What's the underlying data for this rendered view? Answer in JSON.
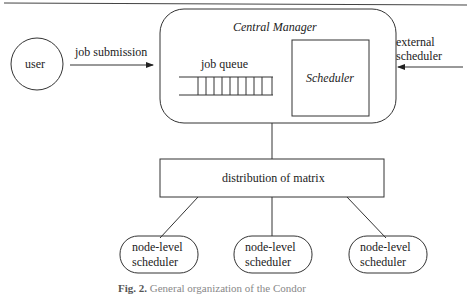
{
  "diagram": {
    "nodes": {
      "user": {
        "label": "user"
      },
      "central_manager": {
        "label": "Central Manager"
      },
      "job_queue": {
        "label": "job queue",
        "slots": 10
      },
      "scheduler": {
        "label": "Scheduler"
      },
      "distribution": {
        "label": "distribution of matrix"
      },
      "node_schedulers": [
        {
          "line1": "node-level",
          "line2": "scheduler"
        },
        {
          "line1": "node-level",
          "line2": "scheduler"
        },
        {
          "line1": "node-level",
          "line2": "scheduler"
        }
      ]
    },
    "edges": {
      "job_submission": {
        "label": "job submission"
      },
      "external_scheduler": {
        "line1": "external",
        "line2": "scheduler"
      }
    },
    "caption": {
      "prefix": "Fig. 2.",
      "text": "General organization of the Condor"
    }
  }
}
